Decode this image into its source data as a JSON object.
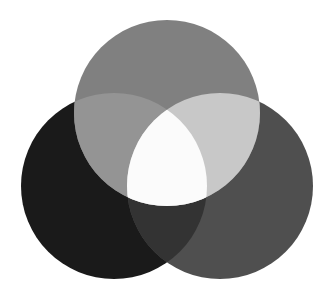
{
  "figure": {
    "name": "three-circle-venn-diagram",
    "background_color": "#ffffff",
    "width": 334,
    "height": 298,
    "blend_mode": "additive-screen-grayscale"
  },
  "chart_data": {
    "type": "venn",
    "title": "",
    "subtitle": "",
    "xlabel": "",
    "ylabel": "",
    "grid": false,
    "legend_position": "none",
    "set_count": 3,
    "radius": 93,
    "sets": [
      {
        "id": "top",
        "label": "",
        "center_x": 167,
        "center_y": 113,
        "color": "#808080"
      },
      {
        "id": "left",
        "label": "",
        "center_x": 114,
        "center_y": 186,
        "color": "#1a1a1a"
      },
      {
        "id": "right",
        "label": "",
        "center_x": 220,
        "center_y": 186,
        "color": "#4f4f4f"
      }
    ],
    "regions": [
      {
        "id": "left-only",
        "members": [
          "left"
        ],
        "color": "#1a1a1a"
      },
      {
        "id": "right-only",
        "members": [
          "right"
        ],
        "color": "#4f4f4f"
      },
      {
        "id": "top-only",
        "members": [
          "top"
        ],
        "color": "#808080"
      },
      {
        "id": "left-right",
        "members": [
          "left",
          "right"
        ],
        "color": "#333333"
      },
      {
        "id": "top-left",
        "members": [
          "top",
          "left"
        ],
        "color": "#949494"
      },
      {
        "id": "top-right",
        "members": [
          "top",
          "right"
        ],
        "color": "#c8c8c8"
      },
      {
        "id": "top-left-right",
        "members": [
          "top",
          "left",
          "right"
        ],
        "color": "#fbfbfb"
      }
    ],
    "annotations": []
  }
}
